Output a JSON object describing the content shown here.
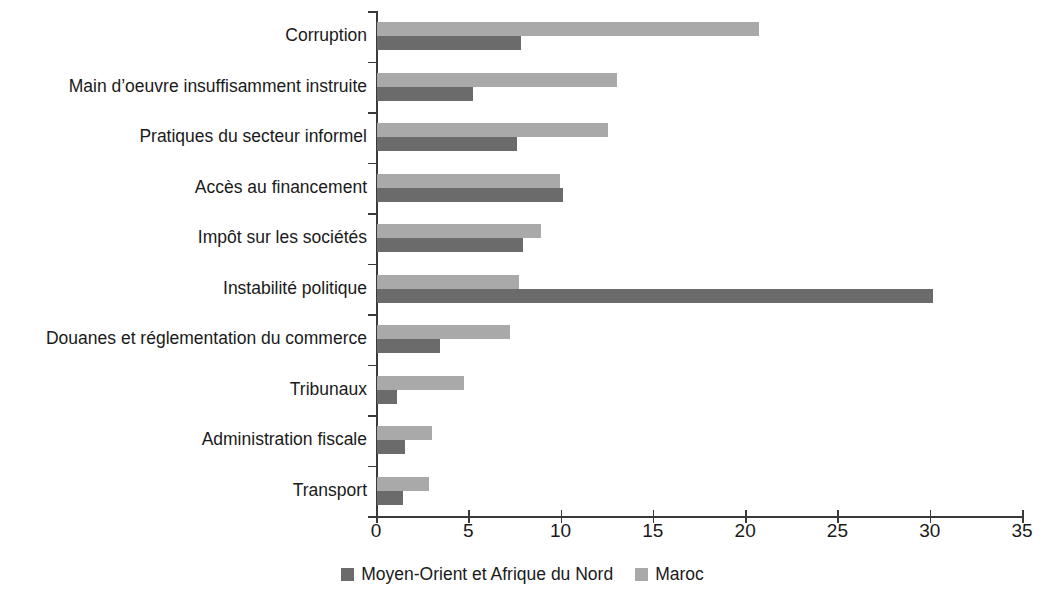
{
  "chart_data": {
    "type": "bar",
    "orientation": "horizontal",
    "title": "",
    "subtitle": "",
    "xlabel": "",
    "ylabel": "",
    "xlim": [
      0,
      35
    ],
    "xticks": [
      0,
      5,
      10,
      15,
      20,
      25,
      30,
      35
    ],
    "xtick_labels": [
      "0",
      "5",
      "10",
      "15",
      "20",
      "25",
      "30",
      "35"
    ],
    "grid": false,
    "legend_position": "bottom-center",
    "categories": [
      "Corruption",
      "Main d’oeuvre insuffisamment instruite",
      "Pratiques du secteur informel",
      "Accès au financement",
      "Impôt sur les sociétés",
      "Instabilité politique",
      "Douanes et réglementation du commerce",
      "Tribunaux",
      "Administration fiscale",
      "Transport"
    ],
    "series": [
      {
        "name": "Moyen-Orient et Afrique du Nord",
        "color": "#6b6b6b",
        "values": [
          7.8,
          5.2,
          7.6,
          10.1,
          7.9,
          30.1,
          3.4,
          1.1,
          1.5,
          1.4
        ]
      },
      {
        "name": "Maroc",
        "color": "#a9a9a9",
        "values": [
          20.7,
          13.0,
          12.5,
          9.9,
          8.9,
          7.7,
          7.2,
          4.7,
          3.0,
          2.8
        ]
      }
    ]
  },
  "legend": {
    "items": [
      {
        "label": "Moyen-Orient et Afrique du Nord",
        "swatch": "dark"
      },
      {
        "label": "Maroc",
        "swatch": "light"
      }
    ]
  },
  "colors": {
    "series_dark": "#6b6b6b",
    "series_light": "#a9a9a9",
    "axis": "#3a3a3a",
    "text": "#1a1a1a",
    "background": "#ffffff"
  }
}
